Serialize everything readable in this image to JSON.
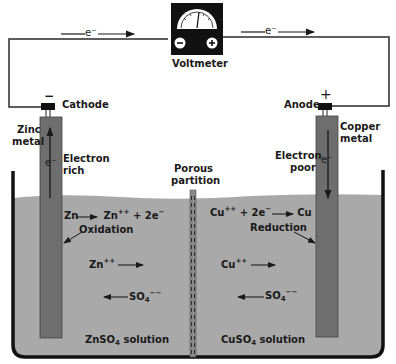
{
  "diagram": {
    "colors": {
      "solution": "#a9a9a9",
      "electrode": "#6e6e6e",
      "wire": "#2a2a2a",
      "voltmeter_body": "#111111",
      "container": "#111111"
    },
    "voltmeter": {
      "label": "Voltmeter",
      "negative_terminal": "−",
      "positive_terminal": "+"
    },
    "wire": {
      "left_electron_label": "e⁻",
      "right_electron_label": "e⁻"
    },
    "left": {
      "terminal_sign": "−",
      "electrode_name": "Cathode",
      "metal_line1": "Zinc",
      "metal_line2": "metal",
      "electron_label": "e⁻",
      "richness_line1": "Electron",
      "richness_line2": "rich",
      "reaction_lhs": "Zn",
      "reaction_rhs_base": "Zn",
      "reaction_rhs_sup": "++",
      "reaction_rhs_tail": " + 2e",
      "reaction_rhs_tail_sup": "−",
      "process": "Oxidation",
      "cation_base": "Zn",
      "cation_sup": "++",
      "anion_base": "SO",
      "anion_sub": "4",
      "anion_sup": "−−",
      "solution_base": "ZnSO",
      "solution_sub": "4",
      "solution_tail": " solution"
    },
    "partition": {
      "line1": "Porous",
      "line2": "partition"
    },
    "right": {
      "terminal_sign": "+",
      "electrode_name": "Anode",
      "metal_line1": "Copper",
      "metal_line2": "metal",
      "electron_label": "e⁻",
      "richness_line1": "Electron",
      "richness_line2": "poor",
      "reaction_lhs_base": "Cu",
      "reaction_lhs_sup": "++",
      "reaction_lhs_tail": " + 2e",
      "reaction_lhs_tail_sup": "−",
      "reaction_rhs": "Cu",
      "process": "Reduction",
      "cation_base": "Cu",
      "cation_sup": "++",
      "anion_base": "SO",
      "anion_sub": "4",
      "anion_sup": "−−",
      "solution_base": "CuSO",
      "solution_sub": "4",
      "solution_tail": " solution"
    }
  }
}
